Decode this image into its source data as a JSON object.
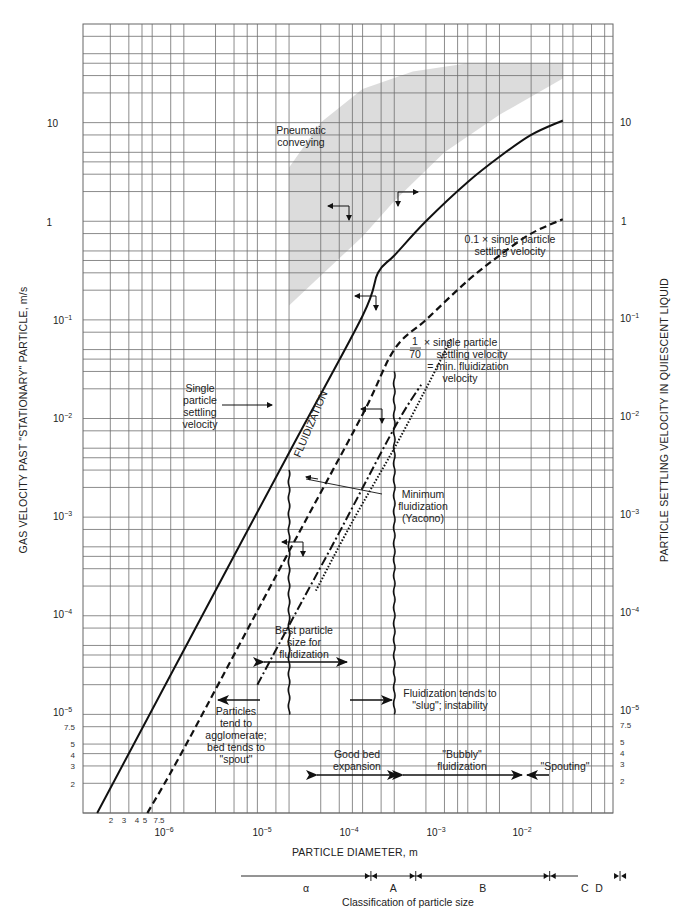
{
  "chart_data": {
    "type": "line",
    "title": "",
    "xscale": "log",
    "yscale": "log",
    "xlabel": "PARTICLE DIAMETER, m",
    "ylabel": "GAS VELOCITY PAST \"STATIONARY\" PARTICLE, m/s",
    "ylabel_right": "PARTICLE SETTLING VELOCITY IN QUIESCENT LIQUID",
    "xlim": [
      1.1e-07,
      0.012
    ],
    "ylim": [
      1e-06,
      100
    ],
    "grid": true,
    "x_ticks": [
      {
        "value": 1e-06,
        "label_base": "10",
        "label_exp": "−6"
      },
      {
        "value": 1e-05,
        "label_base": "10",
        "label_exp": "−5"
      },
      {
        "value": 0.0001,
        "label_base": "10",
        "label_exp": "−4"
      },
      {
        "value": 0.001,
        "label_base": "10",
        "label_exp": "−3"
      },
      {
        "value": 0.01,
        "label_base": "10",
        "label_exp": "−2"
      }
    ],
    "x_minor_labels": [
      {
        "value": 2e-07,
        "label": "2"
      },
      {
        "value": 3e-07,
        "label": "3"
      },
      {
        "value": 4e-07,
        "label": "4"
      },
      {
        "value": 5e-07,
        "label": "5"
      },
      {
        "value": 7.5e-07,
        "label": "7.5"
      }
    ],
    "y_ticks": [
      {
        "value": 10,
        "label_base": "10",
        "label_exp": ""
      },
      {
        "value": 1,
        "label_base": "1",
        "label_exp": ""
      },
      {
        "value": 0.1,
        "label_base": "10",
        "label_exp": "−1"
      },
      {
        "value": 0.01,
        "label_base": "10",
        "label_exp": "−2"
      },
      {
        "value": 0.001,
        "label_base": "10",
        "label_exp": "−3"
      },
      {
        "value": 0.0001,
        "label_base": "10",
        "label_exp": "−4"
      },
      {
        "value": 1e-05,
        "label_base": "10",
        "label_exp": "−5"
      }
    ],
    "y_minor_labels": [
      {
        "value": 7.5e-06,
        "label": "7.5"
      },
      {
        "value": 5e-06,
        "label": "5"
      },
      {
        "value": 4e-06,
        "label": "4"
      },
      {
        "value": 3e-06,
        "label": "3"
      },
      {
        "value": 2e-06,
        "label": "2"
      }
    ],
    "series": [
      {
        "name": "Single particle settling velocity",
        "style": "solid",
        "x": [
          1.5e-07,
          1e-06,
          1e-05,
          5e-05,
          7e-05,
          0.0001,
          0.0002,
          0.0005,
          0.001,
          0.002,
          0.004
        ],
        "y": [
          1e-06,
          4.5e-05,
          0.0045,
          0.11,
          0.3,
          0.45,
          1.0,
          2.5,
          4.5,
          7.5,
          10.5
        ]
      },
      {
        "name": "0.1 × single particle settling velocity",
        "style": "dashed",
        "x": [
          4.5e-07,
          1e-06,
          1e-05,
          5e-05,
          0.0001,
          0.0002,
          0.0005,
          0.001,
          0.002,
          0.004
        ],
        "y": [
          1e-06,
          4.5e-06,
          0.00045,
          0.011,
          0.05,
          0.1,
          0.25,
          0.45,
          0.75,
          1.05
        ]
      },
      {
        "name": "Minimum fluidization (Yacono)",
        "style": "dash-dot",
        "x": [
          5e-06,
          1e-05,
          3e-05,
          0.0001,
          0.00018
        ],
        "y": [
          2e-05,
          8e-05,
          0.0007,
          0.008,
          0.022
        ]
      },
      {
        "name": "1/70 × single particle settling velocity = min. fluidization velocity",
        "style": "dotted",
        "x": [
          1.8e-05,
          4e-05,
          0.0001,
          0.0002,
          0.00035
        ],
        "y": [
          0.00018,
          0.0009,
          0.005,
          0.02,
          0.065
        ]
      }
    ],
    "regions": [
      {
        "name": "Pneumatic conveying",
        "style": "shaded",
        "color": "#d9d9d9"
      }
    ],
    "boundaries": [
      {
        "name": "lower fluidization limit",
        "x": 1e-05,
        "y_range": [
          1e-05,
          0.003
        ],
        "style": "wavy"
      },
      {
        "name": "upper fluidization limit",
        "x": 0.0001,
        "y_range": [
          1e-05,
          0.03
        ],
        "style": "wavy"
      }
    ],
    "annotations": {
      "pneumatic": [
        "Pneumatic",
        "conveying"
      ],
      "single": [
        "Single",
        "particle",
        "settling",
        "velocity"
      ],
      "tenth": [
        "0.1 × single particle",
        "settling velocity"
      ],
      "seventieth_num": "1",
      "seventieth_den": "70",
      "seventieth": [
        "× single particle",
        "settling velocity",
        "= min. fluidization",
        "velocity"
      ],
      "fluidization": "FLUIDIZATION",
      "min_fluid": [
        "Minimum",
        "fluidization",
        "(Yacono)"
      ],
      "best": [
        "Best particle",
        "size for",
        "fluidization"
      ],
      "agglomerate": [
        "Particles",
        "tend to",
        "agglomerate;",
        "bed tends to",
        "\"spout\""
      ],
      "slug": [
        "Fluidization tends to",
        "\"slug\"; instability"
      ],
      "good_bed": [
        "Good bed",
        "expansion"
      ],
      "bubbly": [
        "\"Bubbly\"",
        "fluidization"
      ],
      "spouting": "\"Spouting\""
    },
    "classification": {
      "title": "Classification of particle size",
      "groups": [
        {
          "label": "α",
          "range": [
            null,
            6e-05
          ]
        },
        {
          "label": "A",
          "range": [
            6e-05,
            0.00016
          ]
        },
        {
          "label": "B",
          "range": [
            0.00016,
            0.003
          ]
        },
        {
          "label": "C",
          "range": [
            0.003,
            0.014
          ]
        },
        {
          "label": "D",
          "range": [
            0.014,
            null
          ]
        }
      ]
    },
    "colors": {
      "ink": "#111111",
      "grid": "#6f6f6f",
      "shade": "#d6d6d6"
    }
  }
}
